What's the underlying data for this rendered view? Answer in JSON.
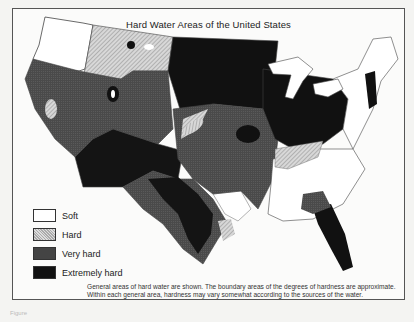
{
  "figure": {
    "title": "Hard Water Areas of the United States",
    "legend": [
      {
        "label": "Soft",
        "swatch": "white"
      },
      {
        "label": "Hard",
        "swatch": "hatched-light-gray"
      },
      {
        "label": "Very hard",
        "swatch": "dark-gray"
      },
      {
        "label": "Extremely hard",
        "swatch": "black"
      }
    ],
    "note": "General areas of hard water are shown. The boundary areas of the degrees of hardness are approximate. Within each general area, hardness may vary somewhat according to the sources of the water.",
    "caption_fragment": "Figure"
  },
  "colors": {
    "soft": "#ffffff",
    "hard": "#c8c8c8",
    "very_hard": "#4a4a4a",
    "extremely_hard": "#111111",
    "border": "#555555"
  }
}
